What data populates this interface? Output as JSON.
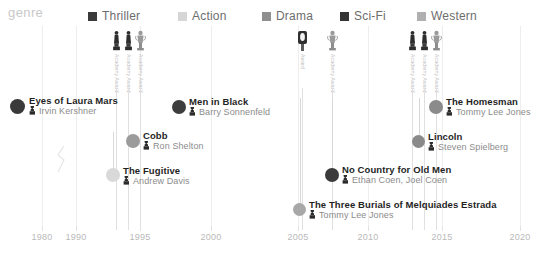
{
  "legend": {
    "title": "genre",
    "items": [
      {
        "label": "Thriller",
        "color": "#3a3a3a",
        "x": 88
      },
      {
        "label": "Action",
        "color": "#d6d6d6",
        "x": 178
      },
      {
        "label": "Drama",
        "color": "#8f8f8f",
        "x": 262
      },
      {
        "label": "Sci-Fi",
        "color": "#343434",
        "x": 340
      },
      {
        "label": "Western",
        "color": "#b0b0b0",
        "x": 417
      }
    ]
  },
  "axis": {
    "ticks": [
      {
        "label": "1980",
        "x": 42
      },
      {
        "label": "1990",
        "x": 76
      },
      {
        "label": "1995",
        "x": 140
      },
      {
        "label": "2000",
        "x": 211
      },
      {
        "label": "2005",
        "x": 298
      },
      {
        "label": "2010",
        "x": 368
      },
      {
        "label": "2015",
        "x": 442
      },
      {
        "label": "2020",
        "x": 520
      }
    ],
    "break_x": 53
  },
  "awards": [
    {
      "x": 110,
      "caption": "Academy Award",
      "kind": "statuette"
    },
    {
      "x": 122,
      "caption": "Academy Award",
      "kind": "statuette"
    },
    {
      "x": 134,
      "caption": "Academy Award",
      "kind": "trophy"
    },
    {
      "x": 296,
      "caption": "Award",
      "kind": "badge"
    },
    {
      "x": 326,
      "caption": "Academy Award",
      "kind": "trophy"
    },
    {
      "x": 406,
      "caption": "Academy Award",
      "kind": "statuette"
    },
    {
      "x": 418,
      "caption": "Academy Award",
      "kind": "statuette"
    },
    {
      "x": 430,
      "caption": "Academy Award",
      "kind": "trophy"
    }
  ],
  "films": [
    {
      "title": "Eyes of Laura Mars",
      "director": "Irvin Kershner",
      "genre": "Thriller",
      "color": "#3a3a3a",
      "dot_x": 10,
      "dot_y": 99,
      "dot_size": 15,
      "text_x": 29,
      "text_y": 95,
      "connector": false
    },
    {
      "title": "Men in Black",
      "director": "Barry Sonnenfeld",
      "genre": "Sci-Fi",
      "color": "#3d3d3d",
      "dot_x": 172,
      "dot_y": 100,
      "dot_size": 14,
      "text_x": 189,
      "text_y": 96,
      "connector": false
    },
    {
      "title": "The Homesman",
      "director": "Tommy Lee Jones",
      "genre": "Western",
      "color": "#8b8b8b",
      "dot_x": 429,
      "dot_y": 100,
      "dot_size": 14,
      "text_x": 446,
      "text_y": 96,
      "connector": false
    },
    {
      "title": "Cobb",
      "director": "Ron Shelton",
      "genre": "Drama",
      "color": "#9b9b9b",
      "dot_x": 126,
      "dot_y": 134,
      "dot_size": 14,
      "text_x": 143,
      "text_y": 130,
      "connector": false
    },
    {
      "title": "Lincoln",
      "director": "Steven Spielberg",
      "genre": "Drama",
      "color": "#8a8a8a",
      "dot_x": 412,
      "dot_y": 135,
      "dot_size": 13,
      "text_x": 428,
      "text_y": 131,
      "connector": true,
      "conn_top": 98,
      "conn_h": 38
    },
    {
      "title": "The Fugitive",
      "director": "Andrew Davis",
      "genre": "Action",
      "color": "#d9d9d9",
      "dot_x": 106,
      "dot_y": 168,
      "dot_size": 14,
      "text_x": 123,
      "text_y": 165,
      "connector": true,
      "conn_top": 132,
      "conn_h": 38
    },
    {
      "title": "No Country for Old Men",
      "director": "Ethan Coen, Joel Coen",
      "genre": "Thriller",
      "color": "#3b3b3b",
      "dot_x": 325,
      "dot_y": 168,
      "dot_size": 14,
      "text_x": 342,
      "text_y": 164,
      "connector": true,
      "conn_top": 98,
      "conn_h": 72
    },
    {
      "title": "The Three Burials of Melquiades Estrada",
      "director": "Tommy Lee Jones",
      "genre": "Western",
      "color": "#a8a8a8",
      "dot_x": 293,
      "dot_y": 203,
      "dot_size": 13,
      "text_x": 309,
      "text_y": 199,
      "connector": true,
      "conn_top": 98,
      "conn_h": 108
    }
  ]
}
